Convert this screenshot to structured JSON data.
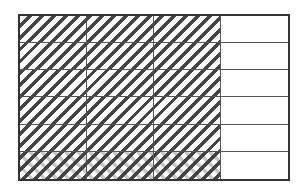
{
  "diagram": {
    "type": "fraction-area-model",
    "columns": 4,
    "rows": 6,
    "shaded_columns": 3,
    "cross_hatched_rows": 1,
    "colors": {
      "border": "#333333",
      "grid_line": "#555555",
      "hatch_dark": "#444444",
      "hatch_light": "#c8c8c8",
      "background": "#ffffff"
    },
    "cells": [
      [
        "hatch",
        "hatch",
        "hatch",
        "empty"
      ],
      [
        "hatch",
        "hatch",
        "hatch",
        "empty"
      ],
      [
        "hatch",
        "hatch",
        "hatch",
        "empty"
      ],
      [
        "hatch",
        "hatch",
        "hatch",
        "empty"
      ],
      [
        "hatch",
        "hatch",
        "hatch",
        "empty"
      ],
      [
        "cross",
        "cross",
        "cross",
        "empty"
      ]
    ]
  }
}
